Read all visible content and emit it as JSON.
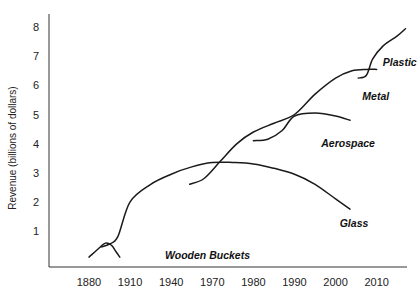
{
  "chart_data": {
    "type": "line",
    "title": "",
    "xlabel": "",
    "ylabel": "Revenue (billions of dollars)",
    "categories": [
      "1880",
      "1910",
      "1940",
      "1970",
      "1980",
      "1990",
      "2000",
      "2010"
    ],
    "yticks": [
      "1",
      "2",
      "3",
      "4",
      "5",
      "6",
      "7",
      "8"
    ],
    "ylim": [
      0,
      8.3
    ],
    "grid": false,
    "legend": "inline labels",
    "series": [
      {
        "name": "Wooden Buckets",
        "label_pos": {
          "x": 1.85,
          "y": 0.05
        },
        "points": [
          [
            0.0,
            0.1
          ],
          [
            0.2,
            0.35
          ],
          [
            0.4,
            0.58
          ],
          [
            0.55,
            0.5
          ],
          [
            0.65,
            0.3
          ],
          [
            0.75,
            0.1
          ]
        ]
      },
      {
        "name": "Glass",
        "label_pos": {
          "x": 6.1,
          "y": 1.15
        },
        "points": [
          [
            0.3,
            0.45
          ],
          [
            0.5,
            0.55
          ],
          [
            0.7,
            0.8
          ],
          [
            1.0,
            2.0
          ],
          [
            1.5,
            2.6
          ],
          [
            2.0,
            2.95
          ],
          [
            2.5,
            3.2
          ],
          [
            3.0,
            3.35
          ],
          [
            3.5,
            3.35
          ],
          [
            4.0,
            3.3
          ],
          [
            4.5,
            3.15
          ],
          [
            5.0,
            2.95
          ],
          [
            5.5,
            2.6
          ],
          [
            6.0,
            2.1
          ],
          [
            6.35,
            1.75
          ]
        ]
      },
      {
        "name": "Metal",
        "label_pos": {
          "x": 6.65,
          "y": 5.5
        },
        "points": [
          [
            2.45,
            2.6
          ],
          [
            2.8,
            2.8
          ],
          [
            3.2,
            3.4
          ],
          [
            3.6,
            4.0
          ],
          [
            4.0,
            4.4
          ],
          [
            4.5,
            4.7
          ],
          [
            5.0,
            5.0
          ],
          [
            5.5,
            5.7
          ],
          [
            6.0,
            6.25
          ],
          [
            6.4,
            6.5
          ],
          [
            6.75,
            6.55
          ],
          [
            7.0,
            6.55
          ]
        ]
      },
      {
        "name": "Aerospace",
        "label_pos": {
          "x": 5.65,
          "y": 3.9
        },
        "points": [
          [
            4.0,
            4.1
          ],
          [
            4.35,
            4.15
          ],
          [
            4.7,
            4.45
          ],
          [
            5.0,
            4.95
          ],
          [
            5.5,
            5.05
          ],
          [
            6.0,
            4.95
          ],
          [
            6.35,
            4.8
          ]
        ]
      },
      {
        "name": "Plastic",
        "label_pos": {
          "x": 7.15,
          "y": 6.65
        },
        "points": [
          [
            6.55,
            6.25
          ],
          [
            6.75,
            6.35
          ],
          [
            6.9,
            6.9
          ],
          [
            7.15,
            7.35
          ],
          [
            7.5,
            7.7
          ],
          [
            7.7,
            7.95
          ]
        ]
      }
    ]
  }
}
